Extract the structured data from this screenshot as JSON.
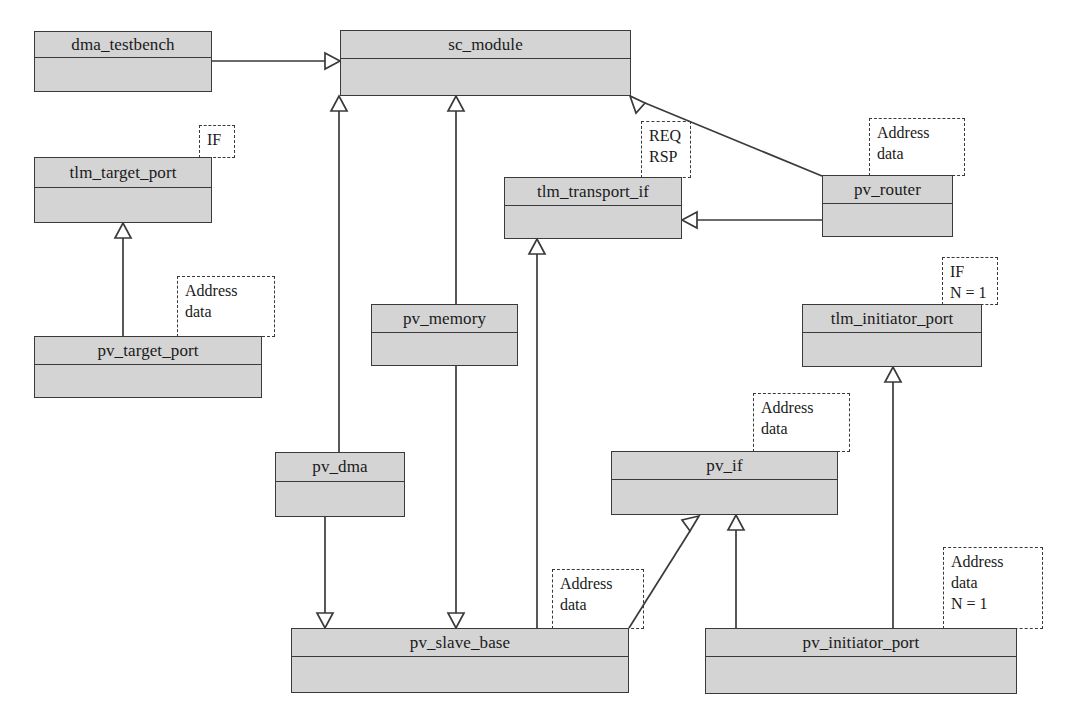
{
  "diagram": {
    "style": {
      "box_fill": "#d4d4d4",
      "box_border": "#3a3a3a",
      "line_color": "#3a3a3a",
      "background": "#ffffff"
    },
    "classes": [
      {
        "id": "dma_testbench",
        "label": "dma_testbench",
        "x": 34,
        "y": 31,
        "w": 178,
        "h": 61,
        "header_h": 26
      },
      {
        "id": "sc_module",
        "label": "sc_module",
        "x": 340,
        "y": 30,
        "w": 291,
        "h": 66,
        "header_h": 28
      },
      {
        "id": "tlm_target_port",
        "label": "tlm_target_port",
        "x": 34,
        "y": 157,
        "w": 178,
        "h": 66,
        "header_h": 30
      },
      {
        "id": "pv_target_port",
        "label": "pv_target_port",
        "x": 34,
        "y": 336,
        "w": 228,
        "h": 62,
        "header_h": 28
      },
      {
        "id": "tlm_transport_if",
        "label": "tlm_transport_if",
        "x": 504,
        "y": 177,
        "w": 178,
        "h": 62,
        "header_h": 28
      },
      {
        "id": "pv_router",
        "label": "pv_router",
        "x": 822,
        "y": 175,
        "w": 131,
        "h": 62,
        "header_h": 28
      },
      {
        "id": "pv_memory",
        "label": "pv_memory",
        "x": 371,
        "y": 304,
        "w": 147,
        "h": 62,
        "header_h": 28
      },
      {
        "id": "tlm_initiator_port",
        "label": "tlm_initiator_port",
        "x": 802,
        "y": 304,
        "w": 180,
        "h": 63,
        "header_h": 28
      },
      {
        "id": "pv_dma",
        "label": "pv_dma",
        "x": 275,
        "y": 452,
        "w": 130,
        "h": 65,
        "header_h": 29
      },
      {
        "id": "pv_if",
        "label": "pv_if",
        "x": 611,
        "y": 451,
        "w": 227,
        "h": 64,
        "header_h": 28
      },
      {
        "id": "pv_slave_base",
        "label": "pv_slave_base",
        "x": 291,
        "y": 628,
        "w": 338,
        "h": 65,
        "header_h": 28
      },
      {
        "id": "pv_initiator_port",
        "label": "pv_initiator_port",
        "x": 705,
        "y": 628,
        "w": 312,
        "h": 66,
        "header_h": 28
      }
    ],
    "notes": [
      {
        "id": "note-if-tlm-target-port",
        "text": "IF",
        "x": 199,
        "y": 125,
        "w": 36,
        "h": 33
      },
      {
        "id": "note-addr-pv-target-port",
        "text": "Address\ndata",
        "x": 177,
        "y": 276,
        "w": 98,
        "h": 61
      },
      {
        "id": "note-req-rsp",
        "text": "REQ\nRSP",
        "x": 641,
        "y": 121,
        "w": 50,
        "h": 57
      },
      {
        "id": "note-addr-pv-router",
        "text": "Address\ndata",
        "x": 869,
        "y": 118,
        "w": 96,
        "h": 58
      },
      {
        "id": "note-if-n1-tlm-init-port",
        "text": "IF\nN = 1",
        "x": 942,
        "y": 257,
        "w": 56,
        "h": 48
      },
      {
        "id": "note-addr-pv-if",
        "text": "Address\ndata",
        "x": 753,
        "y": 393,
        "w": 97,
        "h": 59
      },
      {
        "id": "note-addr-pv-slave-base",
        "text": "Address\ndata",
        "x": 552,
        "y": 569,
        "w": 92,
        "h": 60
      },
      {
        "id": "note-addr-n1-pv-init-port",
        "text": "Address\ndata\nN = 1",
        "x": 943,
        "y": 547,
        "w": 100,
        "h": 82
      }
    ],
    "edges": [
      {
        "id": "dma_testbench-to-sc_module",
        "from": "dma_testbench",
        "to": "sc_module",
        "kind": "generalization"
      },
      {
        "id": "pv_dma-to-sc_module",
        "from": "pv_dma",
        "to": "sc_module",
        "kind": "generalization"
      },
      {
        "id": "pv_memory-to-sc_module",
        "from": "pv_memory",
        "to": "sc_module",
        "kind": "generalization"
      },
      {
        "id": "pv_router-to-sc_module",
        "from": "pv_router",
        "to": "sc_module",
        "kind": "generalization"
      },
      {
        "id": "pv_target_port-to-tlm_target_port",
        "from": "pv_target_port",
        "to": "tlm_target_port",
        "kind": "generalization"
      },
      {
        "id": "pv_router-to-tlm_transport_if",
        "from": "pv_router",
        "to": "tlm_transport_if",
        "kind": "generalization"
      },
      {
        "id": "pv_slave_base-to-tlm_transport_if",
        "from": "pv_slave_base",
        "to": "tlm_transport_if",
        "kind": "generalization"
      },
      {
        "id": "pv_dma-to-pv_slave_base",
        "from": "pv_dma",
        "to": "pv_slave_base",
        "kind": "generalization"
      },
      {
        "id": "pv_memory-to-pv_slave_base",
        "from": "pv_memory",
        "to": "pv_slave_base",
        "kind": "generalization"
      },
      {
        "id": "pv_slave_base-to-pv_if",
        "from": "pv_slave_base",
        "to": "pv_if",
        "kind": "generalization"
      },
      {
        "id": "pv_initiator_port-to-pv_if",
        "from": "pv_initiator_port",
        "to": "pv_if",
        "kind": "generalization"
      },
      {
        "id": "pv_initiator_port-to-tlm_initiator_port",
        "from": "pv_initiator_port",
        "to": "tlm_initiator_port",
        "kind": "generalization"
      }
    ]
  }
}
